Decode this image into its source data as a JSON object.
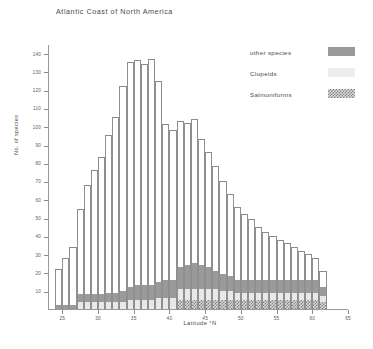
{
  "chart_data": {
    "type": "bar",
    "subtype": "stacked-histogram",
    "title": "Atlantic Coast of North America",
    "xlabel": "Latitude  °N",
    "ylabel": "No. of species",
    "xlim": [
      23,
      65
    ],
    "ylim": [
      0,
      145
    ],
    "ytick_interval": 10,
    "xtick_interval": 5,
    "grid": false,
    "legend_position": "top-right",
    "bar_width_degrees": 1,
    "x": [
      24,
      25,
      26,
      27,
      28,
      29,
      30,
      31,
      32,
      33,
      34,
      35,
      36,
      37,
      38,
      39,
      40,
      41,
      42,
      43,
      44,
      45,
      46,
      47,
      48,
      49,
      50,
      51,
      52,
      53,
      54,
      55,
      56,
      57,
      58,
      59,
      60,
      61
    ],
    "ytick_labels": [
      "140",
      "130",
      "120",
      "110",
      "100",
      "90",
      "80",
      "70",
      "60",
      "50",
      "40",
      "30",
      "20",
      "10"
    ],
    "ytick_values": [
      140,
      130,
      120,
      110,
      100,
      90,
      80,
      70,
      60,
      50,
      40,
      30,
      20,
      10
    ],
    "xtick_labels": [
      "25",
      "30",
      "35",
      "40",
      "45",
      "50",
      "55",
      "60",
      "65"
    ],
    "xtick_values": [
      25,
      30,
      35,
      40,
      45,
      50,
      55,
      60,
      65
    ],
    "series": [
      {
        "name": "Salmoniforms",
        "color": "#d9d9d9",
        "pattern": "hatched",
        "values": [
          0,
          0,
          0,
          0,
          0,
          0,
          0,
          0,
          0,
          0,
          0,
          0,
          0,
          0,
          0,
          0,
          0,
          5,
          5,
          5,
          5,
          5,
          5,
          5,
          5,
          5,
          5,
          5,
          5,
          5,
          5,
          5,
          5,
          5,
          5,
          5,
          5,
          4
        ]
      },
      {
        "name": "Clupeids",
        "color": "#e8e8e8",
        "pattern": "solid-light",
        "values": [
          0,
          0,
          0,
          4,
          4,
          4,
          4,
          4,
          4,
          4,
          5,
          5,
          5,
          5,
          6,
          6,
          6,
          6,
          6,
          6,
          6,
          6,
          6,
          5,
          5,
          4,
          4,
          4,
          4,
          4,
          4,
          4,
          4,
          4,
          4,
          4,
          4,
          3
        ]
      },
      {
        "name": "other species",
        "color": "#9a9a9a",
        "pattern": "solid-gray",
        "values": [
          2,
          2,
          2,
          4,
          4,
          4,
          4,
          5,
          5,
          6,
          7,
          8,
          8,
          8,
          9,
          10,
          10,
          12,
          13,
          14,
          13,
          12,
          10,
          9,
          8,
          7,
          7,
          7,
          7,
          7,
          7,
          7,
          7,
          7,
          7,
          7,
          7,
          5
        ]
      },
      {
        "name": "unfilled remainder",
        "color": "#ffffff",
        "pattern": "open",
        "values": [
          20,
          26,
          32,
          47,
          60,
          68,
          75,
          86,
          96,
          112,
          123,
          123,
          121,
          124,
          110,
          85,
          82,
          80,
          78,
          79,
          69,
          63,
          57,
          51,
          45,
          40,
          36,
          33,
          29,
          26,
          24,
          22,
          20,
          18,
          16,
          14,
          12,
          9
        ]
      }
    ],
    "totals": [
      22,
      28,
      34,
      55,
      68,
      76,
      83,
      95,
      105,
      122,
      135,
      136,
      134,
      137,
      131,
      107,
      103,
      103,
      102,
      104,
      93,
      86,
      78,
      70,
      63,
      56,
      52,
      49,
      45,
      42,
      40,
      38,
      36,
      34,
      32,
      30,
      28,
      21
    ]
  },
  "legend": {
    "items": [
      {
        "label": "other species",
        "swatch": "solid-gray-swatch"
      },
      {
        "label": "Clupeids",
        "swatch": "solid-light-swatch"
      },
      {
        "label": "Salmoniforms",
        "swatch": "hatched-swatch"
      }
    ]
  },
  "colors": {
    "axis": "#9a9a9a",
    "text": "#4a4a4a",
    "other_species": "#9a9a9a",
    "clupeids": "#e8e8e8",
    "salmoniforms": "#808080",
    "background": "#ffffff"
  }
}
